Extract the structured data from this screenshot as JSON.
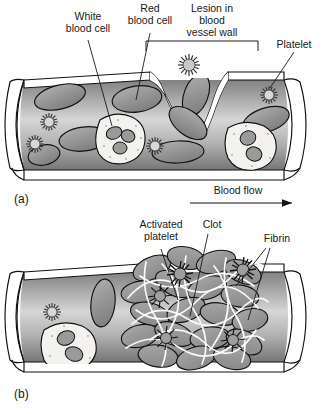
{
  "figure": {
    "panels": [
      {
        "id": "a",
        "panel_label": "(a)",
        "caption": "Intact flow with lesion in vessel wall",
        "flow_label": "Blood flow",
        "labels": [
          {
            "key": "white-blood-cell",
            "text": "White\nblood cell",
            "lines": [
              "White",
              "blood cell"
            ],
            "x": 88,
            "y": 17
          },
          {
            "key": "red-blood-cell",
            "text": "Red\nblood cell",
            "lines": [
              "Red",
              "blood cell"
            ],
            "x": 150,
            "y": 10
          },
          {
            "key": "lesion",
            "text": "Lesion in\nblood\nvessel wall",
            "lines": [
              "Lesion in",
              "blood",
              "vessel wall"
            ],
            "x": 212,
            "y": 10
          },
          {
            "key": "platelet",
            "text": "Platelet",
            "lines": [
              "Platelet"
            ],
            "x": 294,
            "y": 45
          }
        ]
      },
      {
        "id": "b",
        "panel_label": "(b)",
        "caption": "Clot formed from activated platelets, fibrin and trapped cells",
        "labels": [
          {
            "key": "activated-platelet",
            "text": "Activated\nplatelet",
            "lines": [
              "Activated",
              "platelet"
            ],
            "x": 161,
            "y": 226
          },
          {
            "key": "clot",
            "text": "Clot",
            "lines": [
              "Clot"
            ],
            "x": 212,
            "y": 226
          },
          {
            "key": "fibrin",
            "text": "Fibrin",
            "lines": [
              "Fibrin"
            ],
            "x": 275,
            "y": 240
          }
        ]
      }
    ],
    "colors": {
      "ink": "#111111",
      "vessel_dark": "#6f6f6f",
      "vessel_light": "#d8d8d8",
      "rbc_fill": "#9d9d9d",
      "wbc_fill": "#f4f2ef",
      "nucleus": "#9a9a9a",
      "fibrin": "#ffffff",
      "background": "#fefefe"
    }
  }
}
